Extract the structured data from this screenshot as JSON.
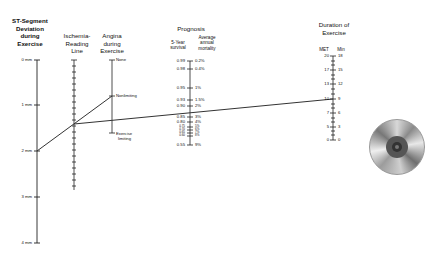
{
  "headers": {
    "st": [
      "ST-Segment",
      "Deviation",
      "during",
      "Exercise"
    ],
    "ischemia": [
      "Ischemia-",
      "Reading",
      "Line"
    ],
    "angina": [
      "Angina",
      "during",
      "Exercise"
    ],
    "prognosis": "Prognosis",
    "survival": [
      "5-Year",
      "survival"
    ],
    "mortality": [
      "Average",
      "annual",
      "mortality"
    ],
    "duration": [
      "Duration of",
      "Exercise"
    ],
    "met": "MET",
    "min": "Min"
  },
  "st_axis": {
    "labels": [
      "0 mm",
      "1 mm",
      "2 mm",
      "3 mm",
      "4 mm"
    ]
  },
  "angina_axis": {
    "labels": [
      "None",
      "Nonlimiting",
      "Exercise",
      "limiting"
    ]
  },
  "prognosis_axis": {
    "survival": [
      "0.99",
      "0.98",
      "0.95",
      "0.93",
      "0.90",
      "0.85",
      "0.80",
      "0.75",
      "0.70",
      "0.65",
      "0.60",
      "0.55"
    ],
    "mortality": [
      "0.2%",
      "0.4%",
      "1%",
      "1.5%",
      "2%",
      "3%",
      "4%",
      "5%",
      "6%",
      "7%",
      "8%",
      "9%"
    ]
  },
  "duration_axis": {
    "met": [
      "20",
      "17",
      "13",
      "10",
      "7",
      "5",
      "0"
    ],
    "min": [
      "18",
      "15",
      "12",
      "9",
      "6",
      "3",
      "0"
    ]
  },
  "example_lines": {
    "line1": "2 mm ST deviation to Nonlimiting angina",
    "line2": "Ischemia line through prognosis to 10 MET / 9 min"
  },
  "disc_icon": "cd-disc-icon"
}
